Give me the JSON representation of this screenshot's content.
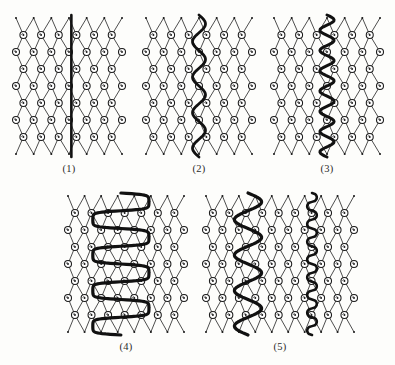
{
  "figure": {
    "title": "",
    "background_color": "#fdfdfb",
    "ink_color": "#1a1a1a",
    "lattice_line_color": "#3a3a3a",
    "highlight_color": "#111111",
    "panels": [
      {
        "id": "panel-1",
        "label": "(1)",
        "x": 10,
        "y": 12,
        "w": 118,
        "h": 148,
        "cols": 7,
        "rows": 9,
        "curve_type": "straight",
        "curve_desc": "single straight vertical thick line through the middle of the lattice",
        "curves": [
          {
            "name": "wall-straight",
            "kind": "straight",
            "center": 0.52,
            "amplitude": 0,
            "periods": 0,
            "thickness": 2.6
          }
        ]
      },
      {
        "id": "panel-2",
        "label": "(2)",
        "x": 140,
        "y": 12,
        "w": 118,
        "h": 148,
        "cols": 7,
        "rows": 9,
        "curve_type": "wave-smooth",
        "curve_desc": "single smooth low-frequency sinusoidal vertical line",
        "curves": [
          {
            "name": "wall-smooth-wave",
            "kind": "sine",
            "center": 0.5,
            "amplitude": 0.055,
            "periods": 4,
            "thickness": 2.8
          }
        ]
      },
      {
        "id": "panel-3",
        "label": "(3)",
        "x": 268,
        "y": 12,
        "w": 118,
        "h": 148,
        "cols": 7,
        "rows": 9,
        "curve_type": "wave-tight",
        "curve_desc": "single tighter higher-frequency sinusoidal vertical line",
        "curves": [
          {
            "name": "wall-tight-wave",
            "kind": "sine",
            "center": 0.5,
            "amplitude": 0.06,
            "periods": 7,
            "thickness": 3.0
          }
        ]
      },
      {
        "id": "panel-4",
        "label": "(4)",
        "x": 62,
        "y": 190,
        "w": 128,
        "h": 148,
        "cols": 8,
        "rows": 9,
        "curve_type": "serpentine",
        "curve_desc": "large-amplitude square serpentine (meander) line folding back on itself",
        "curves": [
          {
            "name": "wall-serpentine",
            "kind": "meander",
            "center": 0.46,
            "amplitude": 0.22,
            "periods": 4,
            "thickness": 3.2
          }
        ]
      },
      {
        "id": "panel-5",
        "label": "(5)",
        "x": 200,
        "y": 190,
        "w": 160,
        "h": 148,
        "cols": 10,
        "rows": 9,
        "curve_type": "double",
        "curve_desc": "two lines: a large smooth meandering wave on the left and a small-amplitude scalloped line on the right",
        "curves": [
          {
            "name": "wall-large-wave",
            "kind": "sine",
            "center": 0.3,
            "amplitude": 0.085,
            "periods": 4,
            "thickness": 3.2
          },
          {
            "name": "wall-small-scallop",
            "kind": "scallop",
            "center": 0.7,
            "amplitude": 0.03,
            "periods": 8,
            "thickness": 2.6
          }
        ]
      }
    ]
  }
}
